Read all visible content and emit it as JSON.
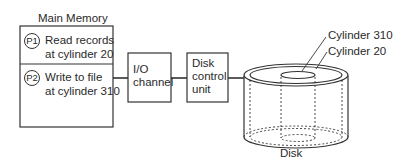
{
  "diagram": {
    "main_memory": {
      "title": "Main Memory",
      "processes": [
        {
          "badge": "P1",
          "line1": "Read records",
          "line2": "at cylinder 20"
        },
        {
          "badge": "P2",
          "line1": "Write to file",
          "line2": "at cylinder 310"
        }
      ]
    },
    "io_channel": {
      "line1": "I/O",
      "line2": "channel"
    },
    "disk_control_unit": {
      "line1": "Disk",
      "line2": "control",
      "line3": "unit"
    },
    "disk": {
      "label": "Disk",
      "cylinder_labels": [
        "Cylinder 310",
        "Cylinder 20"
      ]
    },
    "colors": {
      "stroke": "#333333",
      "text": "#2a2a2a",
      "background": "#ffffff"
    }
  }
}
